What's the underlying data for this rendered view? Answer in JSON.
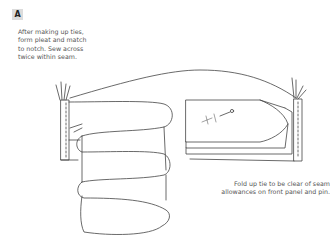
{
  "figure": {
    "label": "A",
    "note_left": {
      "lines": [
        "After making up ties,",
        "form pleat and match",
        "to notch. Sew across",
        "twice within seam."
      ]
    },
    "note_right": {
      "lines": [
        "Fold up tie to be clear of seam",
        "allowances on front panel and pin."
      ]
    },
    "stroke_color": "#444444",
    "badge_bg": "#dcdcdc"
  }
}
